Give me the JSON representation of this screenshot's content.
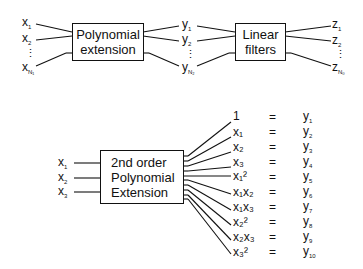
{
  "top_pipeline": {
    "inputs": [
      {
        "base": "x",
        "sub": "1"
      },
      {
        "base": "x",
        "sub": "2"
      },
      {
        "base": "⋮",
        "sub": ""
      },
      {
        "base": "x",
        "sub": "N₁"
      }
    ],
    "block1": {
      "line1": "Polynomial",
      "line2": "extension"
    },
    "middle": [
      {
        "base": "y",
        "sub": "1"
      },
      {
        "base": "y",
        "sub": "2"
      },
      {
        "base": "⋮",
        "sub": ""
      },
      {
        "base": "y",
        "sub": "N₂"
      }
    ],
    "block2": {
      "line1": "Linear",
      "line2": "filters"
    },
    "outputs": [
      {
        "base": "z",
        "sub": "1"
      },
      {
        "base": "z",
        "sub": "2"
      },
      {
        "base": "⋮",
        "sub": ""
      },
      {
        "base": "z",
        "sub": "N₀"
      }
    ]
  },
  "bottom_example": {
    "inputs": [
      {
        "base": "x",
        "sub": "1"
      },
      {
        "base": "x",
        "sub": "2"
      },
      {
        "base": "x",
        "sub": "3"
      }
    ],
    "block": {
      "line1": "2nd order",
      "line2": "Polynomial",
      "line3": "Extension"
    },
    "equals": "=",
    "terms": [
      {
        "term": "1",
        "y": "y",
        "ysub": "1"
      },
      {
        "term": "x₁",
        "y": "y",
        "ysub": "2"
      },
      {
        "term": "x₂",
        "y": "y",
        "ysub": "3"
      },
      {
        "term": "x₃",
        "y": "y",
        "ysub": "4"
      },
      {
        "term": "x₁²",
        "y": "y",
        "ysub": "5"
      },
      {
        "term": "x₁x₂",
        "y": "y",
        "ysub": "6"
      },
      {
        "term": "x₁x₃",
        "y": "y",
        "ysub": "7"
      },
      {
        "term": "x₂²",
        "y": "y",
        "ysub": "8"
      },
      {
        "term": "x₂x₃",
        "y": "y",
        "ysub": "9"
      },
      {
        "term": "x₃²",
        "y": "y",
        "ysub": "10"
      }
    ]
  }
}
